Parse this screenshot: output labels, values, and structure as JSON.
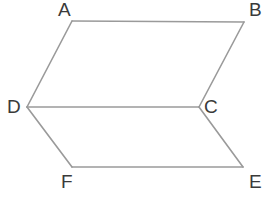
{
  "figure": {
    "background_color": "#ffffff",
    "stroke_color": "#9a9a9a",
    "label_color": "#3a3a3a",
    "stroke_width": 1.6,
    "width": 272,
    "height": 198,
    "vertices": [
      {
        "id": "A",
        "label": "A",
        "x": 72,
        "y": 21,
        "label_x": 58,
        "label_y": 0
      },
      {
        "id": "B",
        "label": "B",
        "x": 244,
        "y": 22,
        "label_x": 249,
        "label_y": 0
      },
      {
        "id": "C",
        "label": "C",
        "x": 199,
        "y": 107,
        "label_x": 204,
        "label_y": 97
      },
      {
        "id": "D",
        "label": "D",
        "x": 27,
        "y": 107,
        "label_x": 7,
        "label_y": 97
      },
      {
        "id": "E",
        "label": "E",
        "x": 243,
        "y": 167,
        "label_x": 249,
        "label_y": 172
      },
      {
        "id": "F",
        "label": "F",
        "x": 72,
        "y": 167,
        "label_x": 61,
        "label_y": 172
      }
    ],
    "edges": [
      {
        "id": "AB",
        "from": "A",
        "to": "B",
        "points": "72,21 244,22"
      },
      {
        "id": "BC",
        "from": "B",
        "to": "C",
        "points": "244,22 199,107"
      },
      {
        "id": "CD",
        "from": "C",
        "to": "D",
        "points": "199,107 27,107"
      },
      {
        "id": "DA",
        "from": "D",
        "to": "A",
        "points": "27,107 72,21"
      },
      {
        "id": "DF",
        "from": "D",
        "to": "F",
        "points": "27,107 72,167"
      },
      {
        "id": "FE",
        "from": "F",
        "to": "E",
        "points": "72,167 243,167"
      },
      {
        "id": "EC",
        "from": "E",
        "to": "C",
        "points": "243,167 199,107"
      }
    ],
    "polygons": [
      {
        "id": "ABCD",
        "points": "72,21 244,22 199,107 27,107"
      },
      {
        "id": "DCEF",
        "points": "27,107 199,107 243,167 72,167"
      }
    ]
  }
}
